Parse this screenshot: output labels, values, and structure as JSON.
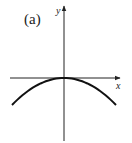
{
  "figure": {
    "panel_label": "(a)",
    "x_axis_label": "x",
    "y_axis_label": "y"
  },
  "chart_data": {
    "type": "line",
    "title": "(a)",
    "xlabel": "x",
    "ylabel": "y",
    "function": "y = -a*x^2",
    "series": [
      {
        "name": "curve",
        "x": [
          -1.0,
          -0.75,
          -0.5,
          -0.25,
          0,
          0.25,
          0.5,
          0.75,
          1.0
        ],
        "y": [
          -1.0,
          -0.5625,
          -0.25,
          -0.0625,
          0,
          -0.0625,
          -0.25,
          -0.5625,
          -1.0
        ]
      }
    ],
    "vertex": [
      0,
      0
    ],
    "grid": false,
    "ticks": false,
    "legend": false
  },
  "colors": {
    "stroke": "#222222",
    "curve": "#111111",
    "background": "#ffffff"
  }
}
